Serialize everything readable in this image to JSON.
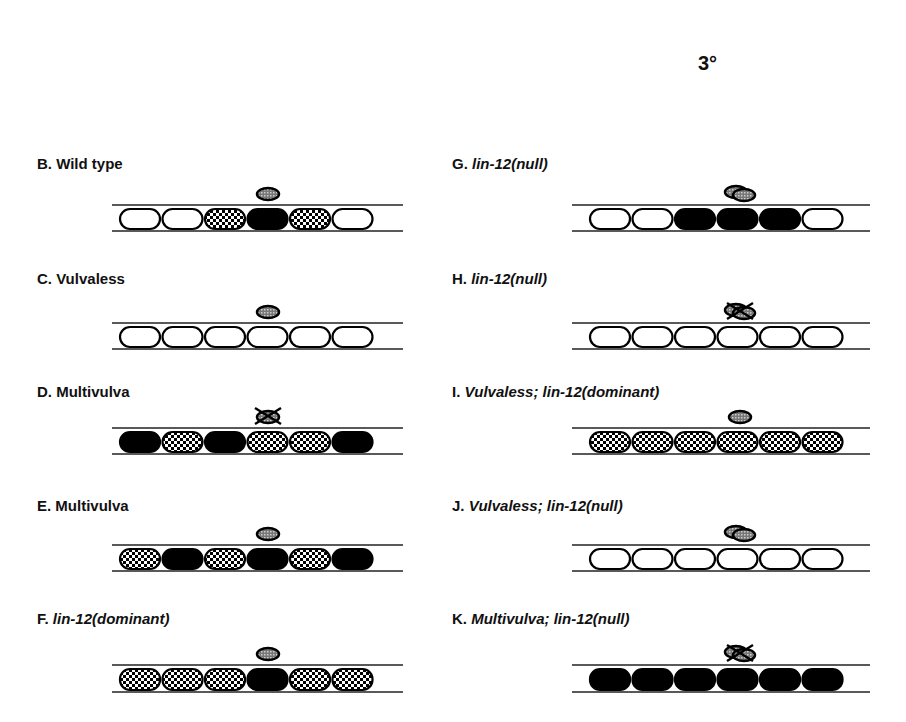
{
  "header": {
    "degree_label": "3°"
  },
  "legend_meaning": {
    "black": "1° fate",
    "checkered": "2° fate",
    "white": "3° fate",
    "anchor_cell": "gonadal anchor cell (speckled oval)",
    "crossed_anchor": "anchor cell ablated"
  },
  "panels": [
    {
      "id": "B",
      "prefix": "B. ",
      "title": "Wild type",
      "italic": false,
      "anchor": "normal",
      "cells": [
        "white",
        "white",
        "check",
        "black",
        "check",
        "white"
      ]
    },
    {
      "id": "C",
      "prefix": "C. ",
      "title": "Vulvaless",
      "italic": false,
      "anchor": "normal",
      "cells": [
        "white",
        "white",
        "white",
        "white",
        "white",
        "white"
      ]
    },
    {
      "id": "D",
      "prefix": "D. ",
      "title": "Multivulva",
      "italic": false,
      "anchor": "ablated",
      "cells": [
        "black",
        "check",
        "black",
        "check",
        "check",
        "black"
      ]
    },
    {
      "id": "E",
      "prefix": "E.  ",
      "title": "Multivulva",
      "italic": false,
      "anchor": "normal",
      "cells": [
        "check",
        "black",
        "check",
        "black",
        "check",
        "black"
      ]
    },
    {
      "id": "F",
      "prefix": "F. ",
      "title": "lin-12(dominant)",
      "italic": true,
      "anchor": "normal",
      "cells": [
        "check",
        "check",
        "check",
        "black",
        "check",
        "check"
      ]
    },
    {
      "id": "G",
      "prefix": "G. ",
      "title": "lin-12(null)",
      "italic": true,
      "anchor": "double",
      "cells": [
        "white",
        "white",
        "black",
        "black",
        "black",
        "white"
      ]
    },
    {
      "id": "H",
      "prefix": "H. ",
      "title": "lin-12(null)",
      "italic": true,
      "anchor": "double-ablated",
      "cells": [
        "white",
        "white",
        "white",
        "white",
        "white",
        "white"
      ]
    },
    {
      "id": "I",
      "prefix": "I. ",
      "title": "Vulvaless; lin-12(dominant)",
      "italic": true,
      "anchor": "normal",
      "cells": [
        "check",
        "check",
        "check",
        "check",
        "check",
        "check"
      ]
    },
    {
      "id": "J",
      "prefix": "J. ",
      "title": "Vulvaless; lin-12(null)",
      "italic": true,
      "anchor": "double",
      "cells": [
        "white",
        "white",
        "white",
        "white",
        "white",
        "white"
      ]
    },
    {
      "id": "K",
      "prefix": "K. ",
      "title": "Multivulva; lin-12(null)",
      "italic": true,
      "anchor": "double-ablated",
      "cells": [
        "black",
        "black",
        "black",
        "black",
        "black",
        "black"
      ]
    }
  ]
}
